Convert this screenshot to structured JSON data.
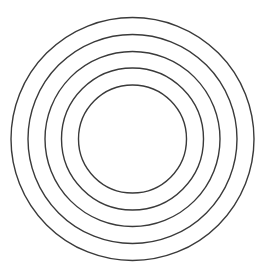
{
  "diagram": {
    "type": "concentric-circles",
    "background": "#ffffff",
    "stroke_color": "#3a3a3a",
    "stroke_width": 1.4,
    "center": {
      "cx": 132.5,
      "cy": 139
    },
    "circles": [
      {
        "r": 121.5
      },
      {
        "r": 104.5
      },
      {
        "r": 87.5
      },
      {
        "r": 71
      },
      {
        "r": 54
      }
    ]
  }
}
